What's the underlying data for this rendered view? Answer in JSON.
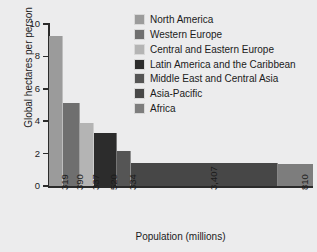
{
  "chart_data": {
    "type": "bar",
    "variant": "variable-width-bar",
    "title": "",
    "xlabel": "Population (millions)",
    "ylabel": "Global hectares per person",
    "ylim": [
      0,
      10
    ],
    "yticks": [
      0,
      2,
      4,
      6,
      8,
      10
    ],
    "ytick_labels": [
      "0",
      "2",
      "4",
      "6",
      "8",
      "10"
    ],
    "grid": false,
    "legend_position": "top-right inside",
    "categories": [
      "North America",
      "Western Europe",
      "Central and Eastern Europe",
      "Latin America and the Caribbean",
      "Middle East and Central Asia",
      "Asia-Pacific",
      "Africa"
    ],
    "xtick_labels": [
      "319",
      "390",
      "337",
      "520",
      "334",
      "3,407",
      "810"
    ],
    "widths": [
      319,
      390,
      337,
      520,
      334,
      3407,
      810
    ],
    "values": [
      9.25,
      5.15,
      3.9,
      3.3,
      2.15,
      1.45,
      1.35
    ],
    "colors": [
      "#9b9b9b",
      "#6f6f6f",
      "#b4b4b4",
      "#2c2c2c",
      "#555555",
      "#474747",
      "#7d7d7d"
    ],
    "series": [
      {
        "name": "Ecological footprint by region",
        "points": [
          {
            "category": "North America",
            "population": 319,
            "value": 9.25,
            "color": "#9b9b9b",
            "xtick": "319"
          },
          {
            "category": "Western Europe",
            "population": 390,
            "value": 5.15,
            "color": "#6f6f6f",
            "xtick": "390"
          },
          {
            "category": "Central and Eastern Europe",
            "population": 337,
            "value": 3.9,
            "color": "#b4b4b4",
            "xtick": "337"
          },
          {
            "category": "Latin America and the Caribbean",
            "population": 520,
            "value": 3.3,
            "color": "#2c2c2c",
            "xtick": "520"
          },
          {
            "category": "Middle East and Central Asia",
            "population": 334,
            "value": 2.15,
            "color": "#555555",
            "xtick": "334"
          },
          {
            "category": "Asia-Pacific",
            "population": 3407,
            "value": 1.45,
            "color": "#474747",
            "xtick": "3,407"
          },
          {
            "category": "Africa",
            "population": 810,
            "value": 1.35,
            "color": "#7d7d7d",
            "xtick": "810"
          }
        ]
      }
    ]
  },
  "legend": {
    "items": [
      {
        "label": "North America",
        "color": "#9b9b9b"
      },
      {
        "label": "Western Europe",
        "color": "#6f6f6f"
      },
      {
        "label": "Central and Eastern Europe",
        "color": "#b4b4b4"
      },
      {
        "label": "Latin America and the Caribbean",
        "color": "#2c2c2c"
      },
      {
        "label": "Middle East and Central Asia",
        "color": "#555555"
      },
      {
        "label": "Asia-Pacific",
        "color": "#474747"
      },
      {
        "label": "Africa",
        "color": "#7d7d7d"
      }
    ]
  },
  "axes": {
    "y_title": "Global hectares per person",
    "x_title": "Population (millions)"
  },
  "style": {
    "background": "#ececed",
    "axis_color": "#2b2b2b",
    "text_color": "#1b1b1b"
  }
}
